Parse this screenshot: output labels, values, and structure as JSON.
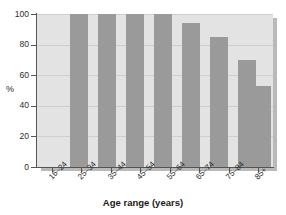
{
  "chart_data": {
    "type": "bar",
    "title": "",
    "subtitle": "",
    "categories": [
      "16–24",
      "25–34",
      "35–44",
      "45–54",
      "55–64",
      "65–74",
      "75–84",
      "85+"
    ],
    "values": [
      100,
      100,
      100,
      100,
      94,
      85,
      70,
      53
    ],
    "xlabel": "Age range (years)",
    "ylabel": "%",
    "ylim": [
      0,
      100
    ],
    "yticks": [
      0,
      20,
      40,
      60,
      80,
      100
    ],
    "ytick_labels": [
      "0",
      "20",
      "40",
      "60",
      "80",
      "100"
    ],
    "grid": true,
    "legend": "none",
    "bar_color": "#9a9a9a",
    "plot_background": "#e3e3e3",
    "page_background": "#ffffff",
    "axis_color": "#555555",
    "gridline_color": "#cfcfcf",
    "xtick_label_rotation": -45
  }
}
